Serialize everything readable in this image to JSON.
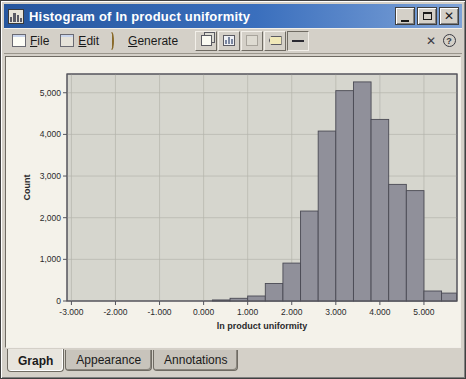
{
  "window": {
    "title": "Histogram of ln product uniformity",
    "buttons": {
      "minimize": "_",
      "maximize": "□",
      "close": "X"
    }
  },
  "menu": {
    "file_label": "File",
    "file_accel": "F",
    "edit_label": "Edit",
    "edit_accel": "E",
    "generate_label": "Generate",
    "generate_accel": "G",
    "toolbar_icons": [
      "copy-pages-icon",
      "chart-icon",
      "disabled-page-icon",
      "tag-icon",
      "legend-line-icon"
    ],
    "close_x_label": "✕",
    "help_label": "?"
  },
  "tabs": [
    {
      "label": "Graph",
      "active": true
    },
    {
      "label": "Appearance",
      "active": false
    },
    {
      "label": "Annotations",
      "active": false
    }
  ],
  "chart_data": {
    "type": "bar",
    "subtype": "histogram",
    "title": "Histogram of ln product uniformity",
    "xlabel": "ln product uniformity",
    "ylabel": "Count",
    "xlim": [
      -3.1,
      5.75
    ],
    "ylim": [
      0,
      5450
    ],
    "grid": true,
    "x_tick_values": [
      -3,
      -2,
      -1,
      0,
      1,
      2,
      3,
      4,
      5
    ],
    "x_tick_labels": [
      "-3.000",
      "-2.000",
      "-1.000",
      "0.000",
      "1.000",
      "2.000",
      "3.000",
      "4.000",
      "5.000"
    ],
    "y_tick_values": [
      0,
      1000,
      2000,
      3000,
      4000,
      5000
    ],
    "y_tick_labels": [
      "0",
      "1,000",
      "2,000",
      "3,000",
      "4,000",
      "5,000"
    ],
    "bin_width": 0.4,
    "bin_edges": [
      0.2,
      0.6,
      1.0,
      1.4,
      1.8,
      2.2,
      2.6,
      3.0,
      3.4,
      3.8,
      4.2,
      4.6,
      5.0,
      5.4,
      5.8
    ],
    "counts": [
      25,
      65,
      120,
      420,
      910,
      2160,
      4080,
      5050,
      5260,
      4360,
      2800,
      2650,
      240,
      190
    ],
    "colors": {
      "plot_bg": "#d6d6ce",
      "grid": "#b4b4ac",
      "frame": "#55555d",
      "bar_fill": "#90909a",
      "bar_stroke": "#4a4a54",
      "text": "#2a2a2a",
      "outer_bg": "#f4f2ea"
    }
  }
}
